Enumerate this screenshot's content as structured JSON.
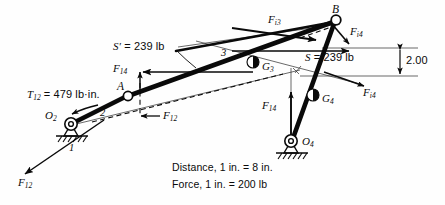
{
  "figure": {
    "background_color": "#fefefe",
    "ink_color": "#0a0a0a"
  },
  "joints": [
    {
      "name": "O2",
      "label": "O",
      "sub": "2",
      "type": "ground-pivot",
      "x": 70,
      "y": 124
    },
    {
      "name": "A",
      "label": "A",
      "sub": "",
      "type": "pin-joint",
      "x": 128,
      "y": 96
    },
    {
      "name": "B",
      "label": "B",
      "sub": "",
      "type": "pin-joint",
      "x": 336,
      "y": 20
    },
    {
      "name": "O4",
      "label": "O",
      "sub": "4",
      "type": "ground-pivot",
      "x": 291,
      "y": 141
    },
    {
      "name": "G3",
      "label": "G",
      "sub": "3",
      "type": "mass-center",
      "x": 253,
      "y": 62
    },
    {
      "name": "G4",
      "label": "G",
      "sub": "4",
      "type": "mass-center",
      "x": 313,
      "y": 95
    }
  ],
  "links": [
    {
      "name": "link-1-ground",
      "number": "1"
    },
    {
      "name": "link-2-crank",
      "number": "2"
    },
    {
      "name": "link-3-coupler",
      "number": "3"
    },
    {
      "name": "link-4-rocker",
      "number": "4"
    }
  ],
  "labels": {
    "s_prime": {
      "text": "S′ = 239 lb",
      "name": "s-prime-force-label"
    },
    "s": {
      "text": "S = 239 lb",
      "name": "s-force-label"
    },
    "torque": {
      "text": "T₁₂ = 479 lb·in.",
      "name": "input-torque-label"
    },
    "dimension": {
      "text": "2.00",
      "name": "dimension-2-00-label"
    },
    "link1": {
      "text": "1",
      "name": "link-1-number"
    },
    "link2": {
      "text": "2",
      "name": "link-2-number"
    },
    "link3": {
      "text": "3",
      "name": "link-3-number"
    }
  },
  "force_vectors": [
    {
      "name": "F12-reaction-arrow",
      "base": "F",
      "sub": "12",
      "description": "ground reaction on link 2, lower-left"
    },
    {
      "name": "F12-dashed-arrow",
      "base": "F",
      "sub": "12",
      "description": "dashed transmitted force at A"
    },
    {
      "name": "F14-at-A-arrow",
      "base": "F",
      "sub": "14",
      "description": "vertical component at A"
    },
    {
      "name": "F14-at-O4-arrow",
      "base": "F",
      "sub": "14",
      "description": "vertical reaction at O4"
    },
    {
      "name": "Fi3-inertia-arrow",
      "base": "F",
      "sub": "i3",
      "description": "inertia force on link 3"
    },
    {
      "name": "Fi4-upper-arrow",
      "base": "F",
      "sub": "i4",
      "description": "inertia force on link 4 at B"
    },
    {
      "name": "Fi4-lower-arrow",
      "base": "F",
      "sub": "i4",
      "description": "inertia force on link 4 at G4"
    }
  ],
  "scales": {
    "distance": "Distance, 1 in. = 8 in.",
    "force": "Force, 1 in. = 200 lb"
  }
}
